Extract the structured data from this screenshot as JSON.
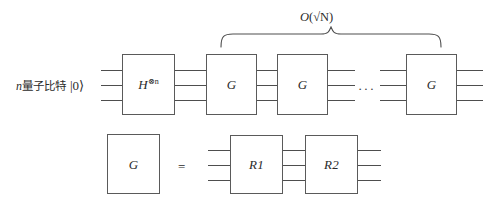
{
  "diagram": {
    "title_text": "Grover quantum circuit",
    "qubit_label": {
      "count_var": "n",
      "cjk_text": "量子比特",
      "state_ket": "|0⟩"
    },
    "brace": {
      "label_fn": "O",
      "label_open": "(",
      "label_radical": "√N",
      "label_close": ")",
      "label_full": "O(√N)"
    },
    "top_row": {
      "hadamard": {
        "base": "H",
        "superscript": "⊗n"
      },
      "gates": [
        {
          "label": "G"
        },
        {
          "label": "G"
        },
        {
          "label": "G"
        }
      ],
      "ellipsis": "···"
    },
    "bottom_row": {
      "left_gate": {
        "label": "G"
      },
      "equals": "=",
      "gates": [
        {
          "label": "R1"
        },
        {
          "label": "R2"
        }
      ]
    },
    "colors": {
      "stroke": "#5a5a5a",
      "wire": "#4e4e4e",
      "text": "#2b2b2b",
      "background": "#ffffff"
    }
  }
}
